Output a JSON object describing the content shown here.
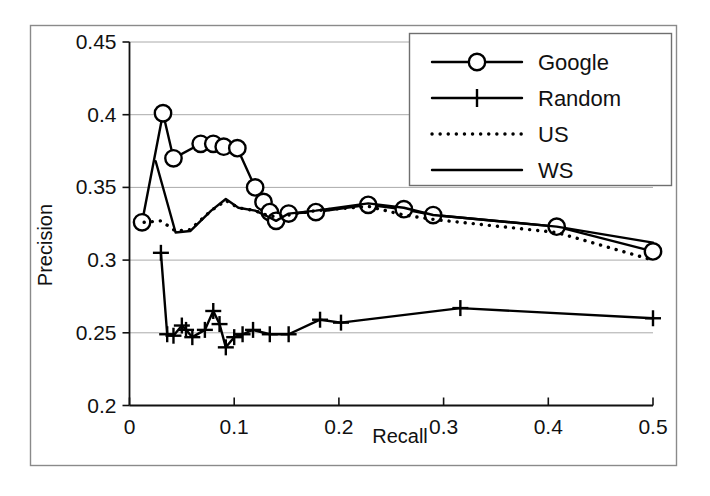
{
  "chart_data": {
    "type": "line",
    "title": "",
    "xlabel": "Recall",
    "ylabel": "Precision",
    "xlim": [
      0,
      0.5
    ],
    "ylim": [
      0.2,
      0.45
    ],
    "xticks": [
      "0",
      "0.1",
      "0.2",
      "0.3",
      "0.4",
      "0.5"
    ],
    "xtick_values": [
      0,
      0.1,
      0.2,
      0.3,
      0.4,
      0.5
    ],
    "yticks": [
      "0.2",
      "0.25",
      "0.3",
      "0.35",
      "0.4",
      "0.45"
    ],
    "ytick_values": [
      0.2,
      0.25,
      0.3,
      0.35,
      0.4,
      0.45
    ],
    "grid": "horizontal",
    "legend_position": "top-right",
    "series": [
      {
        "name": "Google",
        "marker": "circle",
        "linestyle": "solid",
        "color": "#000000",
        "points": [
          [
            0.012,
            0.326
          ],
          [
            0.032,
            0.401
          ],
          [
            0.042,
            0.37
          ],
          [
            0.068,
            0.38
          ],
          [
            0.08,
            0.38
          ],
          [
            0.09,
            0.378
          ],
          [
            0.103,
            0.377
          ],
          [
            0.12,
            0.35
          ],
          [
            0.128,
            0.34
          ],
          [
            0.134,
            0.333
          ],
          [
            0.14,
            0.327
          ],
          [
            0.152,
            0.332
          ],
          [
            0.178,
            0.333
          ],
          [
            0.228,
            0.338
          ],
          [
            0.262,
            0.335
          ],
          [
            0.29,
            0.331
          ],
          [
            0.408,
            0.323
          ],
          [
            0.5,
            0.306
          ]
        ]
      },
      {
        "name": "Random",
        "marker": "plus",
        "linestyle": "solid",
        "color": "#000000",
        "points": [
          [
            0.03,
            0.305
          ],
          [
            0.036,
            0.249
          ],
          [
            0.042,
            0.248
          ],
          [
            0.05,
            0.255
          ],
          [
            0.054,
            0.252
          ],
          [
            0.06,
            0.247
          ],
          [
            0.072,
            0.252
          ],
          [
            0.08,
            0.265
          ],
          [
            0.086,
            0.256
          ],
          [
            0.092,
            0.24
          ],
          [
            0.1,
            0.247
          ],
          [
            0.108,
            0.249
          ],
          [
            0.118,
            0.252
          ],
          [
            0.134,
            0.249
          ],
          [
            0.152,
            0.249
          ],
          [
            0.182,
            0.259
          ],
          [
            0.202,
            0.257
          ],
          [
            0.316,
            0.267
          ],
          [
            0.5,
            0.26
          ]
        ]
      },
      {
        "name": "US",
        "marker": "none",
        "linestyle": "dotted",
        "color": "#000000",
        "points": [
          [
            0.014,
            0.326
          ],
          [
            0.03,
            0.327
          ],
          [
            0.044,
            0.32
          ],
          [
            0.058,
            0.321
          ],
          [
            0.078,
            0.334
          ],
          [
            0.092,
            0.341
          ],
          [
            0.104,
            0.336
          ],
          [
            0.12,
            0.334
          ],
          [
            0.134,
            0.33
          ],
          [
            0.152,
            0.331
          ],
          [
            0.178,
            0.334
          ],
          [
            0.228,
            0.337
          ],
          [
            0.262,
            0.331
          ],
          [
            0.29,
            0.328
          ],
          [
            0.408,
            0.319
          ],
          [
            0.5,
            0.3
          ]
        ]
      },
      {
        "name": "WS",
        "marker": "none",
        "linestyle": "solid",
        "color": "#000000",
        "points": [
          [
            0.025,
            0.368
          ],
          [
            0.044,
            0.319
          ],
          [
            0.058,
            0.32
          ],
          [
            0.078,
            0.334
          ],
          [
            0.092,
            0.342
          ],
          [
            0.104,
            0.336
          ],
          [
            0.12,
            0.334
          ],
          [
            0.132,
            0.33
          ],
          [
            0.14,
            0.327
          ],
          [
            0.152,
            0.332
          ],
          [
            0.178,
            0.334
          ],
          [
            0.228,
            0.339
          ],
          [
            0.262,
            0.336
          ],
          [
            0.29,
            0.331
          ],
          [
            0.408,
            0.323
          ],
          [
            0.5,
            0.312
          ]
        ]
      }
    ]
  },
  "legend": {
    "entries": [
      {
        "label": "Google",
        "marker": "circle",
        "linestyle": "solid"
      },
      {
        "label": "Random",
        "marker": "plus",
        "linestyle": "solid"
      },
      {
        "label": "US",
        "marker": "none",
        "linestyle": "dotted"
      },
      {
        "label": "WS",
        "marker": "none",
        "linestyle": "solid"
      }
    ]
  },
  "axes": {
    "x_title": "Recall",
    "y_title": "Precision"
  },
  "colors": {
    "ink": "#000000",
    "grid": "#aaaaaa",
    "frame": "#888888",
    "background": "#ffffff"
  }
}
